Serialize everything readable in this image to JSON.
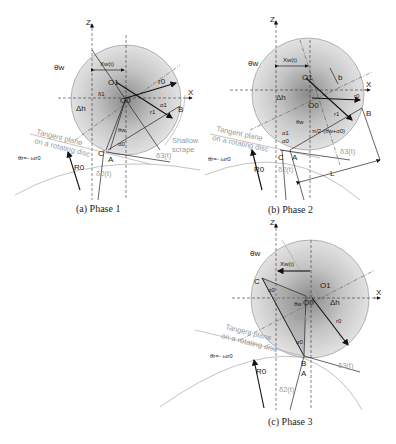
{
  "figure": {
    "panels": [
      {
        "id": "a",
        "caption": "(a) Phase 1",
        "labels": {
          "z": "Z",
          "x": "X",
          "theta_w": "θ̇w",
          "x_w": "Xw(t)",
          "o1": "O1",
          "o0": "O0",
          "r0": "r0",
          "r1": "r1",
          "alpha1": "α1",
          "b": "B",
          "delta1": "δ1",
          "h": "Δh",
          "theta_w2": "θw",
          "alpha0": "α0",
          "c": "C",
          "a": "A",
          "tangent1": "Tangent plane",
          "tangent2": "on a rotating disc",
          "theta_r": "θ̇r=- ωr0",
          "R0": "R0",
          "delta2": "δ2(t)",
          "delta3": "δ3(t)",
          "shallow1": "Shallow",
          "shallow2": "scrape"
        }
      },
      {
        "id": "b",
        "caption": "(b) Phase 2",
        "labels": {
          "z": "Z",
          "x": "X",
          "theta_w": "θ̇w",
          "x_w": "Xw(t)",
          "o1": "O1",
          "o0": "O0",
          "b_small": "b",
          "r0": "r0",
          "r1": "r1",
          "b": "B",
          "h": "Δh",
          "theta_w2": "θw",
          "alpha1": "α1",
          "alpha0": "α0",
          "pi_expr": "π/2-(θw+α0)",
          "c": "C",
          "a": "A",
          "tangent1": "Tangent plane",
          "tangent2": "on a rotating disc",
          "theta_r": "θ̇r=- ωr0",
          "R0": "R0",
          "delta2": "δ2(t)",
          "delta3": "δ3(t)",
          "L": "L"
        }
      },
      {
        "id": "c",
        "caption": "(c) Phase 3",
        "labels": {
          "z": "Z",
          "x": "X",
          "theta_w": "θ̇w",
          "x_w": "Xw(t)",
          "o1": "O1",
          "o0": "O0",
          "c": "C",
          "alpha0_top": "α0",
          "theta_w2": "θw",
          "delta1": "δ1(t)",
          "h": "Δh",
          "r0": "r0",
          "alpha0": "α0",
          "b": "B",
          "a": "A",
          "tangent1": "Tangent plane",
          "tangent2": "on a rotating disc",
          "theta_r": "θ̇r=- ωr0",
          "R0": "R0",
          "delta2": "δ2(t)",
          "delta3": "δ3(t)"
        }
      }
    ]
  }
}
